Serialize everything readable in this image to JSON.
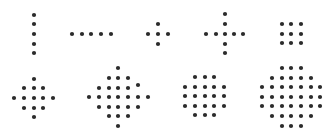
{
  "dot_color": "#2b2b2b",
  "dot_radius": 2.1,
  "patterns": [
    {
      "name": "vertical-line",
      "dots": [
        [
          34,
          15
        ],
        [
          34,
          24
        ],
        [
          34,
          34
        ],
        [
          34,
          44
        ],
        [
          34,
          53
        ]
      ]
    },
    {
      "name": "horizontal-line",
      "dots": [
        [
          72,
          34
        ],
        [
          82,
          34
        ],
        [
          91,
          34
        ],
        [
          101,
          34
        ],
        [
          111,
          34
        ]
      ]
    },
    {
      "name": "small-plus",
      "dots": [
        [
          158,
          24
        ],
        [
          148,
          34
        ],
        [
          158,
          34
        ],
        [
          168,
          34
        ],
        [
          158,
          44
        ]
      ]
    },
    {
      "name": "large-plus",
      "dots": [
        [
          225,
          14
        ],
        [
          225,
          24
        ],
        [
          206,
          34
        ],
        [
          216,
          34
        ],
        [
          225,
          34
        ],
        [
          234,
          34
        ],
        [
          243,
          34
        ],
        [
          225,
          44
        ],
        [
          225,
          53
        ]
      ]
    },
    {
      "name": "square-3x3",
      "dots": [
        [
          282,
          24
        ],
        [
          291,
          24
        ],
        [
          301,
          24
        ],
        [
          282,
          34
        ],
        [
          291,
          34
        ],
        [
          301,
          34
        ],
        [
          282,
          43
        ],
        [
          291,
          43
        ],
        [
          301,
          43
        ]
      ]
    },
    {
      "name": "small-diamond",
      "dots": [
        [
          34,
          79
        ],
        [
          24,
          88
        ],
        [
          34,
          88
        ],
        [
          43,
          88
        ],
        [
          14,
          98
        ],
        [
          24,
          98
        ],
        [
          34,
          98
        ],
        [
          43,
          98
        ],
        [
          53,
          98
        ],
        [
          24,
          108
        ],
        [
          34,
          108
        ],
        [
          43,
          108
        ],
        [
          34,
          117
        ]
      ]
    },
    {
      "name": "large-diamond",
      "dots": [
        [
          118,
          68
        ],
        [
          109,
          78
        ],
        [
          118,
          78
        ],
        [
          128,
          78
        ],
        [
          99,
          88
        ],
        [
          109,
          88
        ],
        [
          118,
          88
        ],
        [
          128,
          88
        ],
        [
          138,
          85
        ],
        [
          89,
          97
        ],
        [
          99,
          97
        ],
        [
          109,
          97
        ],
        [
          118,
          97
        ],
        [
          128,
          97
        ],
        [
          138,
          97
        ],
        [
          148,
          97
        ],
        [
          99,
          107
        ],
        [
          109,
          107
        ],
        [
          118,
          107
        ],
        [
          128,
          107
        ],
        [
          138,
          107
        ],
        [
          109,
          116
        ],
        [
          118,
          116
        ],
        [
          128,
          116
        ],
        [
          118,
          126
        ]
      ]
    },
    {
      "name": "small-octagon",
      "dots": [
        [
          195,
          77
        ],
        [
          205,
          77
        ],
        [
          214,
          77
        ],
        [
          185,
          87
        ],
        [
          195,
          87
        ],
        [
          205,
          87
        ],
        [
          214,
          87
        ],
        [
          224,
          87
        ],
        [
          185,
          96
        ],
        [
          195,
          96
        ],
        [
          205,
          96
        ],
        [
          214,
          96
        ],
        [
          224,
          96
        ],
        [
          185,
          106
        ],
        [
          195,
          106
        ],
        [
          205,
          106
        ],
        [
          214,
          106
        ],
        [
          224,
          106
        ],
        [
          195,
          115
        ],
        [
          205,
          115
        ],
        [
          214,
          115
        ]
      ]
    },
    {
      "name": "large-octagon",
      "dots": [
        [
          282,
          68
        ],
        [
          291,
          68
        ],
        [
          301,
          68
        ],
        [
          272,
          78
        ],
        [
          282,
          78
        ],
        [
          291,
          78
        ],
        [
          301,
          78
        ],
        [
          311,
          78
        ],
        [
          262,
          87
        ],
        [
          272,
          87
        ],
        [
          282,
          87
        ],
        [
          291,
          87
        ],
        [
          301,
          87
        ],
        [
          311,
          87
        ],
        [
          320,
          87
        ],
        [
          262,
          97
        ],
        [
          272,
          97
        ],
        [
          282,
          97
        ],
        [
          291,
          97
        ],
        [
          301,
          97
        ],
        [
          311,
          97
        ],
        [
          320,
          97
        ],
        [
          262,
          106
        ],
        [
          272,
          106
        ],
        [
          282,
          106
        ],
        [
          291,
          106
        ],
        [
          301,
          106
        ],
        [
          311,
          106
        ],
        [
          320,
          106
        ],
        [
          272,
          116
        ],
        [
          282,
          116
        ],
        [
          291,
          116
        ],
        [
          301,
          116
        ],
        [
          311,
          116
        ],
        [
          282,
          126
        ],
        [
          291,
          126
        ],
        [
          301,
          126
        ]
      ]
    }
  ]
}
